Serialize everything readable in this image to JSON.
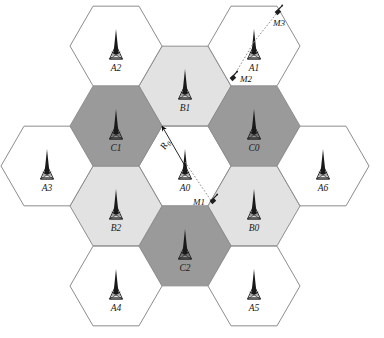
{
  "figure": {
    "width": 384,
    "height": 338,
    "background": "#ffffff",
    "border_color": "#8d8d8d"
  },
  "legend_colors": {
    "group_a_fill": "#ffffff",
    "group_b_fill": "#e2e2e2",
    "group_c_fill": "#9a9a9a",
    "cell_stroke": "#8d8d8d",
    "tower_color": "#1a1a1a",
    "link_color": "#7d7d7d"
  },
  "geometry": {
    "hex_radius": 46,
    "center_x": 185,
    "center_y": 166,
    "orientation": "flat-top"
  },
  "cells": [
    {
      "id": "A0",
      "label": "A0",
      "group": "A",
      "fill": "#ffffff",
      "cx": 185,
      "cy": 166,
      "label_dx": 0,
      "label_dy": 25
    },
    {
      "id": "B1",
      "label": "B1",
      "group": "B",
      "fill": "#e2e2e2",
      "cx": 185,
      "cy": 86,
      "label_dx": 0,
      "label_dy": 25
    },
    {
      "id": "C0",
      "label": "C0",
      "group": "C",
      "fill": "#9a9a9a",
      "cx": 254,
      "cy": 126,
      "label_dx": 0,
      "label_dy": 25
    },
    {
      "id": "B0",
      "label": "B0",
      "group": "B",
      "fill": "#e2e2e2",
      "cx": 254,
      "cy": 206,
      "label_dx": 0,
      "label_dy": 25
    },
    {
      "id": "C2",
      "label": "C2",
      "group": "C",
      "fill": "#9a9a9a",
      "cx": 185,
      "cy": 246,
      "label_dx": 0,
      "label_dy": 25
    },
    {
      "id": "B2",
      "label": "B2",
      "group": "B",
      "fill": "#e2e2e2",
      "cx": 116,
      "cy": 206,
      "label_dx": 0,
      "label_dy": 25
    },
    {
      "id": "C1",
      "label": "C1",
      "group": "C",
      "fill": "#9a9a9a",
      "cx": 116,
      "cy": 126,
      "label_dx": 0,
      "label_dy": 25
    },
    {
      "id": "A2",
      "label": "A2",
      "group": "A",
      "fill": "#ffffff",
      "cx": 116,
      "cy": 46,
      "label_dx": 0,
      "label_dy": 25
    },
    {
      "id": "A1",
      "label": "A1",
      "group": "A",
      "fill": "#ffffff",
      "cx": 254,
      "cy": 46,
      "label_dx": 0,
      "label_dy": 25
    },
    {
      "id": "A6",
      "label": "A6",
      "group": "A",
      "fill": "#ffffff",
      "cx": 323,
      "cy": 166,
      "label_dx": 0,
      "label_dy": 25
    },
    {
      "id": "A5",
      "label": "A5",
      "group": "A",
      "fill": "#ffffff",
      "cx": 254,
      "cy": 286,
      "label_dx": 0,
      "label_dy": 25
    },
    {
      "id": "A4",
      "label": "A4",
      "group": "A",
      "fill": "#ffffff",
      "cx": 116,
      "cy": 286,
      "label_dx": 0,
      "label_dy": 25
    },
    {
      "id": "A3",
      "label": "A3",
      "group": "A",
      "fill": "#ffffff",
      "cx": 47,
      "cy": 166,
      "label_dx": 0,
      "label_dy": 25
    }
  ],
  "mobiles": [
    {
      "id": "M1",
      "label": "M1",
      "x": 212,
      "y": 202,
      "label_side": "left",
      "serving_cell": "A0"
    },
    {
      "id": "M2",
      "label": "M2",
      "x": 232,
      "y": 79,
      "label_side": "right",
      "serving_cell": "A1"
    },
    {
      "id": "M3",
      "label": "M3",
      "x": 277,
      "y": 13,
      "label_side": "below",
      "serving_cell": "A1"
    }
  ],
  "links": [
    {
      "from_cell": "A0",
      "to_mobile": "M1"
    },
    {
      "from_cell": "A1",
      "to_mobile": "M2"
    },
    {
      "from_cell": "A1",
      "to_mobile": "M3"
    }
  ],
  "annotations": {
    "radius": {
      "symbol": "R",
      "subscript": "0",
      "from_x": 185,
      "from_y": 166,
      "to_x": 162,
      "to_y": 126,
      "label_x": 165,
      "label_y": 150
    }
  }
}
